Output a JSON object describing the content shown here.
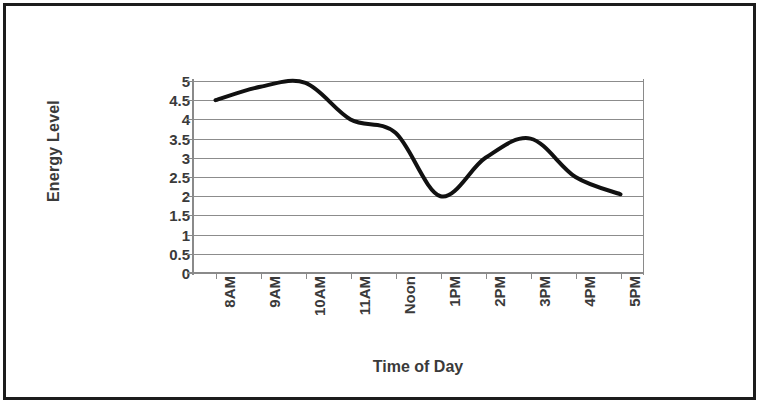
{
  "chart_data": {
    "type": "line",
    "title": "",
    "xlabel": "Time of Day",
    "ylabel": "Energy Level",
    "categories": [
      "8AM",
      "9AM",
      "10AM",
      "11AM",
      "Noon",
      "1PM",
      "2PM",
      "3PM",
      "4PM",
      "5PM"
    ],
    "values": [
      4.5,
      4.85,
      4.95,
      4.0,
      3.65,
      2.0,
      3.0,
      3.5,
      2.5,
      2.05
    ],
    "series": [
      {
        "name": "Energy Level",
        "values": [
          4.5,
          4.85,
          4.95,
          4.0,
          3.65,
          2.0,
          3.0,
          3.5,
          2.5,
          2.05
        ],
        "color": "#111111",
        "smooth": true,
        "line_width": 4,
        "markers": false
      }
    ],
    "ylim": [
      0,
      5
    ],
    "ytick_step": 0.5,
    "ytick_labels": [
      "5",
      "4.5",
      "4",
      "3.5",
      "3",
      "2.5",
      "2",
      "1.5",
      "1",
      "0.5",
      "0"
    ],
    "ytick_values": [
      5,
      4.5,
      4,
      3.5,
      3,
      2.5,
      2,
      1.5,
      1,
      0.5,
      0
    ],
    "grid": {
      "horizontal": true,
      "vertical": false,
      "color": "#8c8c8c"
    },
    "legend": {
      "visible": false,
      "position": "none"
    },
    "axis_color": "#8a8a8a",
    "text_color": "#3a3a3a",
    "background": "#ffffff",
    "border_color": "#1c1c1c",
    "xtick_label_rotation": -90
  }
}
